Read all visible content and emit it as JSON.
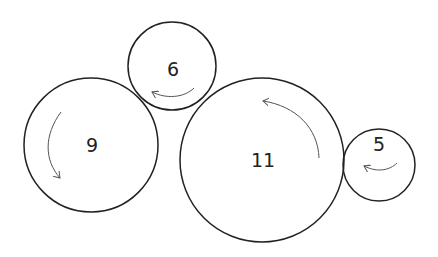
{
  "diagram": {
    "type": "gear-train",
    "stroke_color": "#222222",
    "arrow_color": "#555555",
    "background": "#ffffff",
    "gears": [
      {
        "id": "g9",
        "label": "9",
        "cx": 91,
        "cy": 145,
        "r": 67,
        "rotation": "counterclockwise"
      },
      {
        "id": "g6",
        "label": "6",
        "cx": 172,
        "cy": 66,
        "r": 44,
        "rotation": "clockwise"
      },
      {
        "id": "g11",
        "label": "11",
        "cx": 262,
        "cy": 160,
        "r": 82,
        "rotation": "counterclockwise"
      },
      {
        "id": "g5",
        "label": "5",
        "cx": 379,
        "cy": 165,
        "r": 36,
        "rotation": "clockwise"
      }
    ]
  }
}
